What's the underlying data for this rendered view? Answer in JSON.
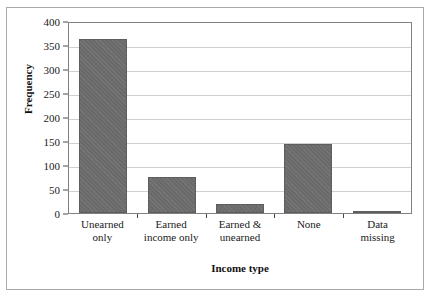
{
  "chart_data": {
    "type": "bar",
    "title": "",
    "subtitle": "",
    "xlabel": "Income type",
    "ylabel": "Frequency",
    "categories": [
      "Unearned only",
      "Earned income only",
      "Earned & unearned",
      "None",
      "Data missing"
    ],
    "category_lines": [
      [
        "Unearned",
        "only"
      ],
      [
        "Earned",
        "income only"
      ],
      [
        "Earned &",
        "unearned"
      ],
      [
        "None",
        ""
      ],
      [
        "Data",
        "missing"
      ]
    ],
    "values": [
      363,
      75,
      18,
      144,
      3
    ],
    "ylim": [
      0,
      400
    ],
    "yticks": [
      0,
      50,
      100,
      150,
      200,
      250,
      300,
      350,
      400
    ],
    "ytick_labels": [
      "0",
      "50",
      "100",
      "150",
      "200",
      "250",
      "300",
      "350",
      "400"
    ],
    "grid": "horizontal",
    "legend": "none",
    "bar_color": "#6e6e6e",
    "gridline_color": "#d0d0d0",
    "axis_color": "#808080",
    "frame_color": "#a9a9a9",
    "background": "#ffffff"
  }
}
